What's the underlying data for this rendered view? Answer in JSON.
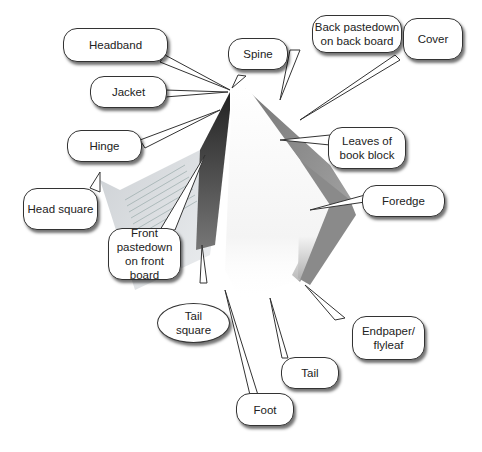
{
  "diagram": {
    "labels": {
      "headband": "Headband",
      "spine": "Spine",
      "back_pastedown": "Back pastedown on back board",
      "cover": "Cover",
      "jacket": "Jacket",
      "hinge": "Hinge",
      "leaves": "Leaves of book block",
      "head_square": "Head square",
      "foredge": "Foredge",
      "front_pastedown": "Front pastedown on front board",
      "tail_square": "Tail square",
      "endpaper": "Endpaper/ flyleaf",
      "tail": "Tail",
      "foot": "Foot"
    },
    "colors": {
      "callout_border": "#333333",
      "callout_fill": "#ffffff",
      "text": "#222222"
    }
  }
}
